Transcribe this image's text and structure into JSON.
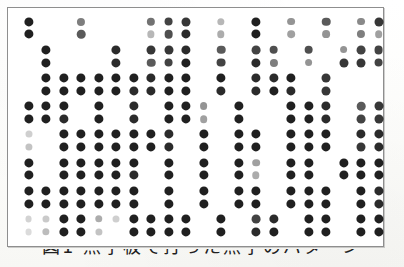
{
  "document": {
    "kind": "scanned-page",
    "figure_caption": "図1 点字板で打った点字のパターン",
    "caption_visibility": "cropped-top-only",
    "background_color": "#fdfdfc",
    "ink_color": "#141414",
    "frame_color": "#8e8e8e"
  },
  "figure": {
    "name": "braille-dot-pattern",
    "frame": {
      "x": 7,
      "y": 7,
      "width": 377,
      "height": 240
    },
    "grid": {
      "columns": 21,
      "row_pairs": 8,
      "rows": 16,
      "column_pitch": 17.5,
      "column_origin": 20.5,
      "pair_pitch": 28.2,
      "pair_origin": 13.5,
      "intra_pair_gap": 12.8,
      "dot_radius_dark": 4.6,
      "dot_radius_faint": 3.2
    },
    "legend": {
      "dark_dot": "embossed dot (fully struck)",
      "faint_dot": "partially struck / faded dot"
    },
    "dots": [
      {
        "r": 0,
        "c": 0,
        "i": 0.95
      },
      {
        "r": 0,
        "c": 3,
        "i": 0.55
      },
      {
        "r": 0,
        "c": 7,
        "i": 0.6
      },
      {
        "r": 0,
        "c": 8,
        "i": 0.8
      },
      {
        "r": 0,
        "c": 9,
        "i": 0.85
      },
      {
        "r": 0,
        "c": 11,
        "i": 0.3
      },
      {
        "r": 0,
        "c": 13,
        "i": 0.95
      },
      {
        "r": 0,
        "c": 15,
        "i": 0.45
      },
      {
        "r": 0,
        "c": 17,
        "i": 0.7
      },
      {
        "r": 0,
        "c": 19,
        "i": 0.5
      },
      {
        "r": 0,
        "c": 20,
        "i": 0.85
      },
      {
        "r": 1,
        "c": 0,
        "i": 0.95
      },
      {
        "r": 1,
        "c": 3,
        "i": 0.7
      },
      {
        "r": 1,
        "c": 7,
        "i": 0.3
      },
      {
        "r": 1,
        "c": 8,
        "i": 0.75
      },
      {
        "r": 1,
        "c": 9,
        "i": 0.9
      },
      {
        "r": 1,
        "c": 11,
        "i": 0.35
      },
      {
        "r": 1,
        "c": 13,
        "i": 0.95
      },
      {
        "r": 1,
        "c": 15,
        "i": 0.4
      },
      {
        "r": 1,
        "c": 17,
        "i": 0.45
      },
      {
        "r": 1,
        "c": 19,
        "i": 0.55
      },
      {
        "r": 1,
        "c": 20,
        "i": 0.4
      },
      {
        "r": 2,
        "c": 1,
        "i": 0.95
      },
      {
        "r": 2,
        "c": 5,
        "i": 0.9
      },
      {
        "r": 2,
        "c": 7,
        "i": 0.85
      },
      {
        "r": 2,
        "c": 8,
        "i": 0.85
      },
      {
        "r": 2,
        "c": 9,
        "i": 0.9
      },
      {
        "r": 2,
        "c": 11,
        "i": 0.7
      },
      {
        "r": 2,
        "c": 13,
        "i": 0.8
      },
      {
        "r": 2,
        "c": 14,
        "i": 0.75
      },
      {
        "r": 2,
        "c": 16,
        "i": 0.75
      },
      {
        "r": 2,
        "c": 18,
        "i": 0.45
      },
      {
        "r": 2,
        "c": 19,
        "i": 0.8
      },
      {
        "r": 2,
        "c": 20,
        "i": 0.8
      },
      {
        "r": 3,
        "c": 1,
        "i": 0.95
      },
      {
        "r": 3,
        "c": 5,
        "i": 0.9
      },
      {
        "r": 3,
        "c": 7,
        "i": 0.7
      },
      {
        "r": 3,
        "c": 8,
        "i": 0.8
      },
      {
        "r": 3,
        "c": 9,
        "i": 0.95
      },
      {
        "r": 3,
        "c": 11,
        "i": 0.8
      },
      {
        "r": 3,
        "c": 13,
        "i": 0.9
      },
      {
        "r": 3,
        "c": 14,
        "i": 0.55
      },
      {
        "r": 3,
        "c": 16,
        "i": 0.45
      },
      {
        "r": 3,
        "c": 18,
        "i": 0.85
      },
      {
        "r": 3,
        "c": 19,
        "i": 0.85
      },
      {
        "r": 3,
        "c": 20,
        "i": 0.8
      },
      {
        "r": 4,
        "c": 1,
        "i": 0.95
      },
      {
        "r": 4,
        "c": 2,
        "i": 0.95
      },
      {
        "r": 4,
        "c": 3,
        "i": 0.95
      },
      {
        "r": 4,
        "c": 4,
        "i": 0.95
      },
      {
        "r": 4,
        "c": 5,
        "i": 0.95
      },
      {
        "r": 4,
        "c": 6,
        "i": 0.95
      },
      {
        "r": 4,
        "c": 7,
        "i": 0.9
      },
      {
        "r": 4,
        "c": 8,
        "i": 0.95
      },
      {
        "r": 4,
        "c": 9,
        "i": 0.95
      },
      {
        "r": 4,
        "c": 11,
        "i": 0.95
      },
      {
        "r": 4,
        "c": 13,
        "i": 0.9
      },
      {
        "r": 4,
        "c": 14,
        "i": 0.9
      },
      {
        "r": 4,
        "c": 15,
        "i": 0.95
      },
      {
        "r": 4,
        "c": 17,
        "i": 0.85
      },
      {
        "r": 5,
        "c": 1,
        "i": 0.95
      },
      {
        "r": 5,
        "c": 2,
        "i": 0.95
      },
      {
        "r": 5,
        "c": 3,
        "i": 0.95
      },
      {
        "r": 5,
        "c": 4,
        "i": 0.95
      },
      {
        "r": 5,
        "c": 5,
        "i": 0.95
      },
      {
        "r": 5,
        "c": 6,
        "i": 0.9
      },
      {
        "r": 5,
        "c": 7,
        "i": 0.9
      },
      {
        "r": 5,
        "c": 8,
        "i": 0.95
      },
      {
        "r": 5,
        "c": 9,
        "i": 0.95
      },
      {
        "r": 5,
        "c": 11,
        "i": 0.9
      },
      {
        "r": 5,
        "c": 13,
        "i": 0.9
      },
      {
        "r": 5,
        "c": 14,
        "i": 0.95
      },
      {
        "r": 5,
        "c": 15,
        "i": 0.9
      },
      {
        "r": 5,
        "c": 17,
        "i": 0.85
      },
      {
        "r": 6,
        "c": 0,
        "i": 0.95
      },
      {
        "r": 6,
        "c": 1,
        "i": 0.95
      },
      {
        "r": 6,
        "c": 2,
        "i": 0.95
      },
      {
        "r": 6,
        "c": 4,
        "i": 0.95
      },
      {
        "r": 6,
        "c": 6,
        "i": 0.9
      },
      {
        "r": 6,
        "c": 8,
        "i": 0.95
      },
      {
        "r": 6,
        "c": 9,
        "i": 0.95
      },
      {
        "r": 6,
        "c": 10,
        "i": 0.45
      },
      {
        "r": 6,
        "c": 12,
        "i": 0.95
      },
      {
        "r": 6,
        "c": 15,
        "i": 0.95
      },
      {
        "r": 6,
        "c": 16,
        "i": 0.95
      },
      {
        "r": 6,
        "c": 17,
        "i": 0.9
      },
      {
        "r": 6,
        "c": 19,
        "i": 0.7
      },
      {
        "r": 6,
        "c": 20,
        "i": 0.85
      },
      {
        "r": 7,
        "c": 0,
        "i": 0.95
      },
      {
        "r": 7,
        "c": 1,
        "i": 0.95
      },
      {
        "r": 7,
        "c": 2,
        "i": 0.9
      },
      {
        "r": 7,
        "c": 4,
        "i": 0.95
      },
      {
        "r": 7,
        "c": 6,
        "i": 0.9
      },
      {
        "r": 7,
        "c": 8,
        "i": 0.95
      },
      {
        "r": 7,
        "c": 9,
        "i": 0.95
      },
      {
        "r": 7,
        "c": 10,
        "i": 0.4
      },
      {
        "r": 7,
        "c": 12,
        "i": 0.95
      },
      {
        "r": 7,
        "c": 15,
        "i": 0.95
      },
      {
        "r": 7,
        "c": 16,
        "i": 0.95
      },
      {
        "r": 7,
        "c": 17,
        "i": 0.9
      },
      {
        "r": 7,
        "c": 19,
        "i": 0.8
      },
      {
        "r": 7,
        "c": 20,
        "i": 0.85
      },
      {
        "r": 8,
        "c": 0,
        "i": 0.2
      },
      {
        "r": 8,
        "c": 2,
        "i": 0.95
      },
      {
        "r": 8,
        "c": 3,
        "i": 0.95
      },
      {
        "r": 8,
        "c": 4,
        "i": 0.95
      },
      {
        "r": 8,
        "c": 5,
        "i": 0.95
      },
      {
        "r": 8,
        "c": 6,
        "i": 0.95
      },
      {
        "r": 8,
        "c": 7,
        "i": 0.95
      },
      {
        "r": 8,
        "c": 8,
        "i": 0.9
      },
      {
        "r": 8,
        "c": 10,
        "i": 0.95
      },
      {
        "r": 8,
        "c": 12,
        "i": 0.95
      },
      {
        "r": 8,
        "c": 13,
        "i": 0.95
      },
      {
        "r": 8,
        "c": 15,
        "i": 0.95
      },
      {
        "r": 8,
        "c": 16,
        "i": 0.95
      },
      {
        "r": 8,
        "c": 17,
        "i": 0.95
      },
      {
        "r": 8,
        "c": 19,
        "i": 0.9
      },
      {
        "r": 8,
        "c": 20,
        "i": 0.9
      },
      {
        "r": 9,
        "c": 0,
        "i": 0.25
      },
      {
        "r": 9,
        "c": 2,
        "i": 0.95
      },
      {
        "r": 9,
        "c": 3,
        "i": 0.95
      },
      {
        "r": 9,
        "c": 4,
        "i": 0.95
      },
      {
        "r": 9,
        "c": 5,
        "i": 0.95
      },
      {
        "r": 9,
        "c": 6,
        "i": 0.95
      },
      {
        "r": 9,
        "c": 7,
        "i": 0.95
      },
      {
        "r": 9,
        "c": 8,
        "i": 0.9
      },
      {
        "r": 9,
        "c": 10,
        "i": 0.95
      },
      {
        "r": 9,
        "c": 12,
        "i": 0.95
      },
      {
        "r": 9,
        "c": 13,
        "i": 0.95
      },
      {
        "r": 9,
        "c": 15,
        "i": 0.95
      },
      {
        "r": 9,
        "c": 16,
        "i": 0.95
      },
      {
        "r": 9,
        "c": 17,
        "i": 0.95
      },
      {
        "r": 9,
        "c": 19,
        "i": 0.85
      },
      {
        "r": 9,
        "c": 20,
        "i": 0.9
      },
      {
        "r": 10,
        "c": 0,
        "i": 0.95
      },
      {
        "r": 10,
        "c": 2,
        "i": 0.95
      },
      {
        "r": 10,
        "c": 3,
        "i": 0.95
      },
      {
        "r": 10,
        "c": 4,
        "i": 0.95
      },
      {
        "r": 10,
        "c": 5,
        "i": 0.95
      },
      {
        "r": 10,
        "c": 6,
        "i": 0.95
      },
      {
        "r": 10,
        "c": 8,
        "i": 0.95
      },
      {
        "r": 10,
        "c": 10,
        "i": 0.95
      },
      {
        "r": 10,
        "c": 12,
        "i": 0.95
      },
      {
        "r": 10,
        "c": 13,
        "i": 0.4
      },
      {
        "r": 10,
        "c": 15,
        "i": 0.95
      },
      {
        "r": 10,
        "c": 16,
        "i": 0.95
      },
      {
        "r": 10,
        "c": 18,
        "i": 0.95
      },
      {
        "r": 10,
        "c": 19,
        "i": 0.95
      },
      {
        "r": 10,
        "c": 20,
        "i": 0.95
      },
      {
        "r": 11,
        "c": 0,
        "i": 0.95
      },
      {
        "r": 11,
        "c": 2,
        "i": 0.95
      },
      {
        "r": 11,
        "c": 3,
        "i": 0.95
      },
      {
        "r": 11,
        "c": 4,
        "i": 0.95
      },
      {
        "r": 11,
        "c": 5,
        "i": 0.95
      },
      {
        "r": 11,
        "c": 6,
        "i": 0.9
      },
      {
        "r": 11,
        "c": 8,
        "i": 0.95
      },
      {
        "r": 11,
        "c": 10,
        "i": 0.95
      },
      {
        "r": 11,
        "c": 12,
        "i": 0.95
      },
      {
        "r": 11,
        "c": 13,
        "i": 0.35
      },
      {
        "r": 11,
        "c": 15,
        "i": 0.95
      },
      {
        "r": 11,
        "c": 16,
        "i": 0.95
      },
      {
        "r": 11,
        "c": 18,
        "i": 0.95
      },
      {
        "r": 11,
        "c": 19,
        "i": 0.95
      },
      {
        "r": 11,
        "c": 20,
        "i": 0.95
      },
      {
        "r": 12,
        "c": 0,
        "i": 0.95
      },
      {
        "r": 12,
        "c": 1,
        "i": 0.95
      },
      {
        "r": 12,
        "c": 2,
        "i": 0.95
      },
      {
        "r": 12,
        "c": 3,
        "i": 0.95
      },
      {
        "r": 12,
        "c": 4,
        "i": 0.95
      },
      {
        "r": 12,
        "c": 5,
        "i": 0.95
      },
      {
        "r": 12,
        "c": 6,
        "i": 0.95
      },
      {
        "r": 12,
        "c": 8,
        "i": 0.95
      },
      {
        "r": 12,
        "c": 10,
        "i": 0.95
      },
      {
        "r": 12,
        "c": 12,
        "i": 0.95
      },
      {
        "r": 12,
        "c": 13,
        "i": 0.95
      },
      {
        "r": 12,
        "c": 15,
        "i": 0.95
      },
      {
        "r": 12,
        "c": 16,
        "i": 0.95
      },
      {
        "r": 12,
        "c": 17,
        "i": 0.95
      },
      {
        "r": 12,
        "c": 19,
        "i": 0.95
      },
      {
        "r": 12,
        "c": 20,
        "i": 0.9
      },
      {
        "r": 13,
        "c": 0,
        "i": 0.95
      },
      {
        "r": 13,
        "c": 1,
        "i": 0.95
      },
      {
        "r": 13,
        "c": 2,
        "i": 0.95
      },
      {
        "r": 13,
        "c": 3,
        "i": 0.95
      },
      {
        "r": 13,
        "c": 4,
        "i": 0.95
      },
      {
        "r": 13,
        "c": 5,
        "i": 0.95
      },
      {
        "r": 13,
        "c": 6,
        "i": 0.95
      },
      {
        "r": 13,
        "c": 8,
        "i": 0.95
      },
      {
        "r": 13,
        "c": 10,
        "i": 0.95
      },
      {
        "r": 13,
        "c": 12,
        "i": 0.95
      },
      {
        "r": 13,
        "c": 13,
        "i": 0.95
      },
      {
        "r": 13,
        "c": 15,
        "i": 0.95
      },
      {
        "r": 13,
        "c": 16,
        "i": 0.95
      },
      {
        "r": 13,
        "c": 17,
        "i": 0.95
      },
      {
        "r": 13,
        "c": 19,
        "i": 0.95
      },
      {
        "r": 13,
        "c": 20,
        "i": 0.9
      },
      {
        "r": 14,
        "c": 0,
        "i": 0.18
      },
      {
        "r": 14,
        "c": 1,
        "i": 0.22
      },
      {
        "r": 14,
        "c": 2,
        "i": 0.95
      },
      {
        "r": 14,
        "c": 3,
        "i": 0.95
      },
      {
        "r": 14,
        "c": 4,
        "i": 0.35
      },
      {
        "r": 14,
        "c": 5,
        "i": 0.2
      },
      {
        "r": 14,
        "c": 6,
        "i": 0.95
      },
      {
        "r": 14,
        "c": 7,
        "i": 0.95
      },
      {
        "r": 14,
        "c": 8,
        "i": 0.95
      },
      {
        "r": 14,
        "c": 9,
        "i": 0.95
      },
      {
        "r": 14,
        "c": 11,
        "i": 0.95
      },
      {
        "r": 14,
        "c": 13,
        "i": 0.8
      },
      {
        "r": 14,
        "c": 14,
        "i": 0.9
      },
      {
        "r": 14,
        "c": 16,
        "i": 0.95
      },
      {
        "r": 14,
        "c": 17,
        "i": 0.95
      },
      {
        "r": 14,
        "c": 19,
        "i": 0.95
      },
      {
        "r": 14,
        "c": 20,
        "i": 0.95
      },
      {
        "r": 15,
        "c": 0,
        "i": 0.15
      },
      {
        "r": 15,
        "c": 1,
        "i": 0.28
      },
      {
        "r": 15,
        "c": 2,
        "i": 0.95
      },
      {
        "r": 15,
        "c": 3,
        "i": 0.95
      },
      {
        "r": 15,
        "c": 4,
        "i": 0.25
      },
      {
        "r": 15,
        "c": 6,
        "i": 0.95
      },
      {
        "r": 15,
        "c": 7,
        "i": 0.95
      },
      {
        "r": 15,
        "c": 8,
        "i": 0.95
      },
      {
        "r": 15,
        "c": 9,
        "i": 0.95
      },
      {
        "r": 15,
        "c": 11,
        "i": 0.95
      },
      {
        "r": 15,
        "c": 13,
        "i": 0.9
      },
      {
        "r": 15,
        "c": 14,
        "i": 0.95
      },
      {
        "r": 15,
        "c": 16,
        "i": 0.95
      },
      {
        "r": 15,
        "c": 17,
        "i": 0.95
      },
      {
        "r": 15,
        "c": 19,
        "i": 0.95
      },
      {
        "r": 15,
        "c": 20,
        "i": 0.95
      }
    ]
  }
}
